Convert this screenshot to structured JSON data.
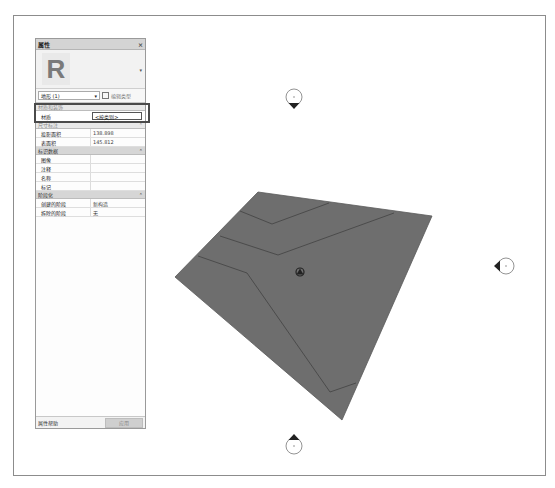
{
  "properties_panel": {
    "title": "属性",
    "close_glyph": "×",
    "type_selector": {
      "label": "地形 (1)",
      "dropdown_glyph": "⌄"
    },
    "edit_type_label": "编辑类型",
    "type_preview_letter": "R",
    "sections": [
      {
        "label": "材质和装饰",
        "collapse_glyph": "",
        "rows": [
          {
            "key": "材质",
            "value": "<按类别>"
          }
        ]
      },
      {
        "label": "尺寸标注",
        "collapse_glyph": "⌃",
        "rows": [
          {
            "key": "投影面积",
            "value": "138.898"
          },
          {
            "key": "表面积",
            "value": "145.812"
          }
        ]
      },
      {
        "label": "标识数据",
        "collapse_glyph": "⌃",
        "rows": [
          {
            "key": "图像",
            "value": ""
          },
          {
            "key": "注释",
            "value": ""
          },
          {
            "key": "名称",
            "value": ""
          },
          {
            "key": "标记",
            "value": ""
          }
        ]
      },
      {
        "label": "阶段化",
        "collapse_glyph": "⌃",
        "rows": [
          {
            "key": "创建的阶段",
            "value": "新构造"
          },
          {
            "key": "拆除的阶段",
            "value": "无"
          }
        ]
      }
    ],
    "footer": {
      "help_label": "属性帮助",
      "apply_label": "应用"
    }
  },
  "viewport": {
    "surface_color": "#6e6e6e",
    "edge_color": "#3c3c3c",
    "elevation_markers": [
      {
        "position": "north"
      },
      {
        "position": "east"
      },
      {
        "position": "south"
      }
    ]
  }
}
